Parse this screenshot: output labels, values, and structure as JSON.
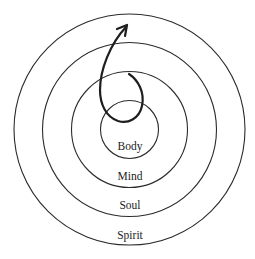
{
  "diagram": {
    "type": "concentric-circles",
    "center": {
      "x": 129.5,
      "y": 129.5
    },
    "stroke_color": "#2b2b2b",
    "rings": [
      {
        "name": "Body",
        "radius": 29,
        "label_y": 150
      },
      {
        "name": "Mind",
        "radius": 58,
        "label_y": 180
      },
      {
        "name": "Soul",
        "radius": 87,
        "label_y": 209
      },
      {
        "name": "Spirit",
        "radius": 115.5,
        "label_y": 239
      }
    ],
    "arrow": {
      "description": "spiral arrow emerging from inner circle, looping and pointing outward/upward",
      "icon": "spiral-arrow-icon"
    },
    "labels": {
      "body": "Body",
      "mind": "Mind",
      "soul": "Soul",
      "spirit": "Spirit"
    }
  }
}
